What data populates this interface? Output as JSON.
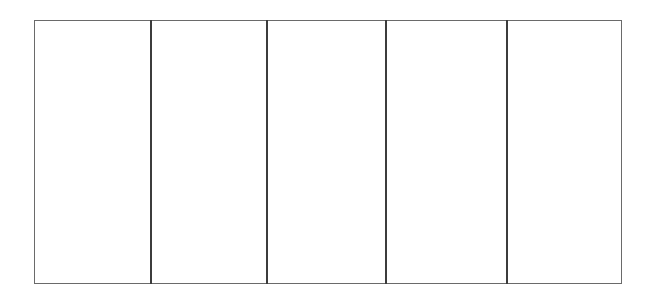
{
  "diagram": {
    "type": "panel-grid",
    "panel_count": 5,
    "frame": {
      "x": 34,
      "y": 20,
      "width": 588,
      "height": 264,
      "border_color": "#6a6a6a"
    },
    "divider_color": "#3c3c3c",
    "divider_x": [
      150,
      267,
      385,
      506
    ],
    "panels": [
      {
        "index": 1,
        "label": ""
      },
      {
        "index": 2,
        "label": ""
      },
      {
        "index": 3,
        "label": ""
      },
      {
        "index": 4,
        "label": ""
      },
      {
        "index": 5,
        "label": ""
      }
    ]
  }
}
